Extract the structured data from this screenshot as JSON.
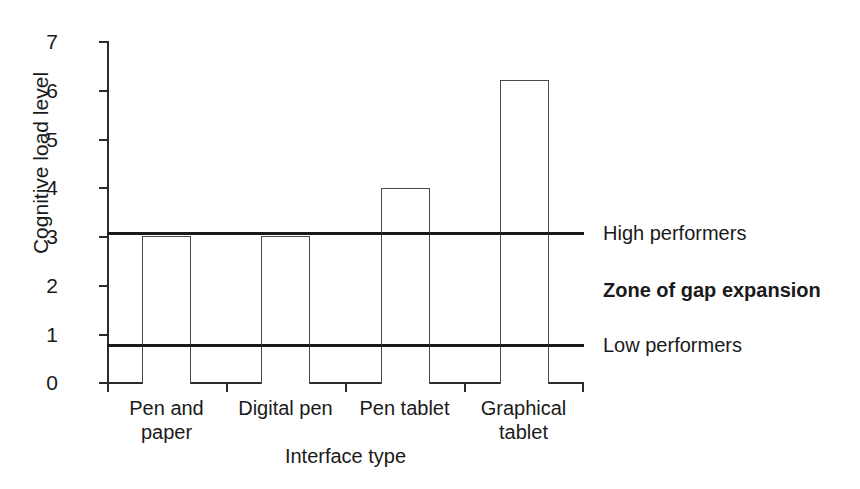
{
  "chart_data": {
    "type": "bar",
    "title": "",
    "xlabel": "Interface type",
    "ylabel": "Cognitive load level",
    "categories": [
      "Pen and paper",
      "Digital pen",
      "Pen tablet",
      "Graphical tablet"
    ],
    "values": [
      3,
      3,
      4,
      6.2
    ],
    "ylim": [
      0,
      7
    ],
    "yticks": [
      0,
      1,
      2,
      3,
      4,
      5,
      6,
      7
    ],
    "ytick_labels": [
      "0",
      "1",
      "2",
      "3",
      "4",
      "5",
      "6",
      "7"
    ],
    "grid": false,
    "legend": "none",
    "bar_style": {
      "fill": "#ffffff",
      "edge": "#4a4a4a"
    },
    "reference_lines": [
      {
        "name": "high-performers",
        "label": "High performers",
        "value": 3.07,
        "color": "#1a1a1a",
        "bold": false
      },
      {
        "name": "low-performers",
        "label": "Low performers",
        "value": 0.78,
        "color": "#1a1a1a",
        "bold": false
      }
    ],
    "annotations": [
      {
        "name": "zone-of-gap-expansion",
        "label": "Zone of gap expansion",
        "value": 1.9,
        "bold": true
      }
    ]
  },
  "axis": {
    "y_title": "Cognitive load level",
    "x_title": "Interface type"
  },
  "categories": [
    {
      "line1": "Pen and",
      "line2": "paper"
    },
    {
      "line1": "Digital pen",
      "line2": ""
    },
    {
      "line1": "Pen tablet",
      "line2": ""
    },
    {
      "line1": "Graphical",
      "line2": "tablet"
    }
  ],
  "yticks": [
    "7",
    "6",
    "5",
    "4",
    "3",
    "2",
    "1",
    "0"
  ],
  "right_labels": {
    "high": "High performers",
    "zone": "Zone of gap expansion",
    "low": "Low performers"
  }
}
